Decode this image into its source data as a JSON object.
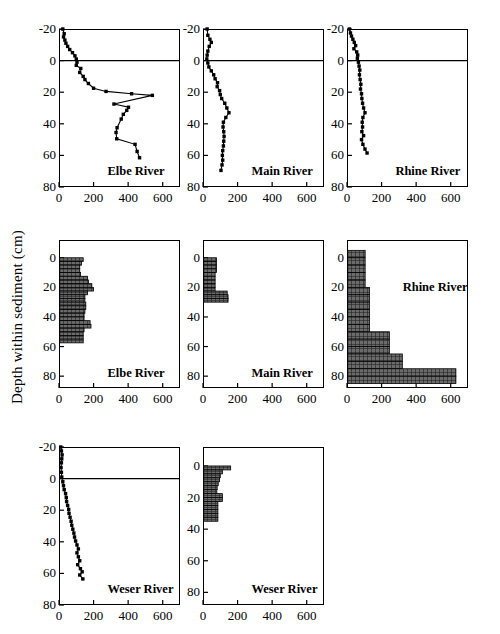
{
  "figure": {
    "y_axis_label": "Depth within sediment (cm)",
    "background_color": "#ffffff",
    "line_color": "#000000",
    "marker_color": "#000000",
    "bar_fill_color": "#6b6b6b",
    "bar_edge_color": "#000000"
  },
  "axes": {
    "y_ticks_profile": [
      "-20",
      "0",
      "20",
      "40",
      "60",
      "80"
    ],
    "y_ticks_bar": [
      "0",
      "20",
      "40",
      "60",
      "80"
    ],
    "x_ticks": [
      "0",
      "200",
      "400",
      "600"
    ],
    "ylim_profile": [
      -20,
      80
    ],
    "ylim_bar": [
      -12,
      88
    ],
    "xlim": [
      0,
      700
    ]
  },
  "panels": [
    {
      "key": "p1",
      "title": "Elbe River",
      "type": "line"
    },
    {
      "key": "p2",
      "title": "Main River",
      "type": "line"
    },
    {
      "key": "p3",
      "title": "Rhine River",
      "type": "line"
    },
    {
      "key": "p4",
      "title": "Elbe River",
      "type": "bar"
    },
    {
      "key": "p5",
      "title": "Main River",
      "type": "bar"
    },
    {
      "key": "p6",
      "title": "Rhine River",
      "type": "bar"
    },
    {
      "key": "p7",
      "title": "Weser River",
      "type": "line"
    },
    {
      "key": "p8",
      "title": "Weser River",
      "type": "bar"
    }
  ],
  "chart_data": [
    {
      "id": "elbe-profile",
      "type": "line",
      "title": "Elbe River",
      "xlabel": "",
      "ylabel": "Depth within sediment (cm)",
      "xlim": [
        0,
        700
      ],
      "ylim": [
        -20,
        80
      ],
      "y_inverted": true,
      "grid": false,
      "legend": "none",
      "x_ticks": [
        0,
        200,
        400,
        600
      ],
      "y_ticks": [
        -20,
        0,
        20,
        40,
        60,
        80
      ],
      "interface_line_y": 0,
      "points": [
        {
          "x": 22,
          "y": -20.0
        },
        {
          "x": 30,
          "y": -17.0
        },
        {
          "x": 26,
          "y": -15.0
        },
        {
          "x": 34,
          "y": -13.0
        },
        {
          "x": 40,
          "y": -11.0
        },
        {
          "x": 50,
          "y": -9.0
        },
        {
          "x": 62,
          "y": -7.0
        },
        {
          "x": 78,
          "y": -5.0
        },
        {
          "x": 92,
          "y": -3.0
        },
        {
          "x": 100,
          "y": -1.0
        },
        {
          "x": 104,
          "y": 1.0
        },
        {
          "x": 100,
          "y": 3.0
        },
        {
          "x": 126,
          "y": 5.0
        },
        {
          "x": 120,
          "y": 7.5
        },
        {
          "x": 140,
          "y": 10.0
        },
        {
          "x": 150,
          "y": 12.0
        },
        {
          "x": 170,
          "y": 14.5
        },
        {
          "x": 200,
          "y": 17.5
        },
        {
          "x": 272,
          "y": 19.5
        },
        {
          "x": 420,
          "y": 21.0
        },
        {
          "x": 540,
          "y": 22.0
        },
        {
          "x": 318,
          "y": 27.5
        },
        {
          "x": 402,
          "y": 29.5
        },
        {
          "x": 392,
          "y": 31.5
        },
        {
          "x": 372,
          "y": 34.0
        },
        {
          "x": 360,
          "y": 37.0
        },
        {
          "x": 336,
          "y": 42.5
        },
        {
          "x": 330,
          "y": 45.5
        },
        {
          "x": 334,
          "y": 49.5
        },
        {
          "x": 440,
          "y": 53.0
        },
        {
          "x": 452,
          "y": 57.5
        },
        {
          "x": 466,
          "y": 61.5
        }
      ]
    },
    {
      "id": "main-profile",
      "type": "line",
      "title": "Main River",
      "xlim": [
        0,
        700
      ],
      "ylim": [
        -20,
        80
      ],
      "y_inverted": true,
      "grid": false,
      "legend": "none",
      "x_ticks": [
        0,
        200,
        400,
        600
      ],
      "y_ticks": [
        -20,
        0,
        20,
        40,
        60,
        80
      ],
      "interface_line_y": 0,
      "points": [
        {
          "x": 24,
          "y": -20.0
        },
        {
          "x": 28,
          "y": -16.0
        },
        {
          "x": 40,
          "y": -13.5
        },
        {
          "x": 48,
          "y": -11.5
        },
        {
          "x": 36,
          "y": -9.0
        },
        {
          "x": 28,
          "y": -6.0
        },
        {
          "x": 24,
          "y": -3.5
        },
        {
          "x": 22,
          "y": -1.0
        },
        {
          "x": 28,
          "y": 1.5
        },
        {
          "x": 34,
          "y": 4.0
        },
        {
          "x": 48,
          "y": 6.5
        },
        {
          "x": 62,
          "y": 9.0
        },
        {
          "x": 70,
          "y": 11.5
        },
        {
          "x": 84,
          "y": 14.0
        },
        {
          "x": 82,
          "y": 16.5
        },
        {
          "x": 96,
          "y": 19.0
        },
        {
          "x": 100,
          "y": 21.5
        },
        {
          "x": 108,
          "y": 24.0
        },
        {
          "x": 126,
          "y": 27.0
        },
        {
          "x": 138,
          "y": 30.0
        },
        {
          "x": 150,
          "y": 33.0
        },
        {
          "x": 132,
          "y": 36.0
        },
        {
          "x": 118,
          "y": 39.0
        },
        {
          "x": 116,
          "y": 42.0
        },
        {
          "x": 120,
          "y": 45.0
        },
        {
          "x": 122,
          "y": 48.0
        },
        {
          "x": 120,
          "y": 51.0
        },
        {
          "x": 118,
          "y": 54.0
        },
        {
          "x": 114,
          "y": 57.0
        },
        {
          "x": 112,
          "y": 60.0
        },
        {
          "x": 114,
          "y": 63.0
        },
        {
          "x": 110,
          "y": 66.0
        },
        {
          "x": 104,
          "y": 69.5
        }
      ]
    },
    {
      "id": "rhine-profile",
      "type": "line",
      "title": "Rhine River",
      "xlim": [
        0,
        700
      ],
      "ylim": [
        -20,
        80
      ],
      "y_inverted": true,
      "grid": false,
      "legend": "none",
      "x_ticks": [
        0,
        200,
        400,
        600
      ],
      "y_ticks": [
        -20,
        0,
        20,
        40,
        60,
        80
      ],
      "interface_line_y": 0,
      "points": [
        {
          "x": 14,
          "y": -20.0
        },
        {
          "x": 20,
          "y": -17.5
        },
        {
          "x": 26,
          "y": -15.5
        },
        {
          "x": 34,
          "y": -13.5
        },
        {
          "x": 42,
          "y": -11.5
        },
        {
          "x": 50,
          "y": -9.5
        },
        {
          "x": 40,
          "y": -7.5
        },
        {
          "x": 56,
          "y": -5.5
        },
        {
          "x": 62,
          "y": -3.5
        },
        {
          "x": 60,
          "y": -1.5
        },
        {
          "x": 66,
          "y": 1.0
        },
        {
          "x": 70,
          "y": 3.5
        },
        {
          "x": 74,
          "y": 6.0
        },
        {
          "x": 72,
          "y": 9.0
        },
        {
          "x": 76,
          "y": 12.0
        },
        {
          "x": 80,
          "y": 15.0
        },
        {
          "x": 78,
          "y": 18.0
        },
        {
          "x": 84,
          "y": 21.0
        },
        {
          "x": 86,
          "y": 24.0
        },
        {
          "x": 90,
          "y": 27.0
        },
        {
          "x": 96,
          "y": 30.0
        },
        {
          "x": 104,
          "y": 33.0
        },
        {
          "x": 92,
          "y": 36.0
        },
        {
          "x": 88,
          "y": 39.0
        },
        {
          "x": 90,
          "y": 42.0
        },
        {
          "x": 86,
          "y": 45.0
        },
        {
          "x": 96,
          "y": 47.5
        },
        {
          "x": 84,
          "y": 50.0
        },
        {
          "x": 92,
          "y": 53.0
        },
        {
          "x": 104,
          "y": 56.0
        },
        {
          "x": 116,
          "y": 58.5
        }
      ]
    },
    {
      "id": "elbe-bar",
      "type": "bar",
      "title": "Elbe River",
      "xlim": [
        0,
        700
      ],
      "ylim": [
        -12,
        88
      ],
      "y_inverted": true,
      "grid": false,
      "legend": "none",
      "x_ticks": [
        0,
        200,
        400,
        600
      ],
      "y_ticks": [
        0,
        20,
        40,
        60,
        80
      ],
      "orientation": "horizontal",
      "bin_height": 2.5,
      "bins": [
        {
          "depth_top": 0.0,
          "value": 140
        },
        {
          "depth_top": 2.5,
          "value": 130
        },
        {
          "depth_top": 5.0,
          "value": 120
        },
        {
          "depth_top": 7.5,
          "value": 120
        },
        {
          "depth_top": 10.0,
          "value": 125
        },
        {
          "depth_top": 12.5,
          "value": 165
        },
        {
          "depth_top": 15.0,
          "value": 170
        },
        {
          "depth_top": 17.5,
          "value": 190
        },
        {
          "depth_top": 20.0,
          "value": 200
        },
        {
          "depth_top": 22.5,
          "value": 165
        },
        {
          "depth_top": 25.0,
          "value": 150
        },
        {
          "depth_top": 27.5,
          "value": 150
        },
        {
          "depth_top": 30.0,
          "value": 155
        },
        {
          "depth_top": 32.5,
          "value": 155
        },
        {
          "depth_top": 35.0,
          "value": 150
        },
        {
          "depth_top": 37.5,
          "value": 145
        },
        {
          "depth_top": 40.0,
          "value": 145
        },
        {
          "depth_top": 42.5,
          "value": 180
        },
        {
          "depth_top": 45.0,
          "value": 185
        },
        {
          "depth_top": 47.5,
          "value": 145
        },
        {
          "depth_top": 50.0,
          "value": 140
        },
        {
          "depth_top": 52.5,
          "value": 140
        },
        {
          "depth_top": 55.0,
          "value": 140
        }
      ]
    },
    {
      "id": "main-bar",
      "type": "bar",
      "title": "Main River",
      "xlim": [
        0,
        700
      ],
      "ylim": [
        -12,
        88
      ],
      "y_inverted": true,
      "grid": false,
      "legend": "none",
      "x_ticks": [
        0,
        200,
        400,
        600
      ],
      "y_ticks": [
        0,
        20,
        40,
        60,
        80
      ],
      "orientation": "horizontal",
      "bin_height": 2.5,
      "bins": [
        {
          "depth_top": 0.0,
          "value": 78
        },
        {
          "depth_top": 2.5,
          "value": 78
        },
        {
          "depth_top": 5.0,
          "value": 78
        },
        {
          "depth_top": 7.5,
          "value": 78
        },
        {
          "depth_top": 10.0,
          "value": 70
        },
        {
          "depth_top": 12.5,
          "value": 70
        },
        {
          "depth_top": 15.0,
          "value": 70
        },
        {
          "depth_top": 17.5,
          "value": 70
        },
        {
          "depth_top": 20.0,
          "value": 70
        },
        {
          "depth_top": 22.5,
          "value": 140
        },
        {
          "depth_top": 25.0,
          "value": 145
        },
        {
          "depth_top": 27.5,
          "value": 145
        }
      ]
    },
    {
      "id": "rhine-bar",
      "type": "bar",
      "title": "Rhine River",
      "xlim": [
        0,
        700
      ],
      "ylim": [
        -12,
        88
      ],
      "y_inverted": true,
      "grid": false,
      "legend": "none",
      "x_ticks": [
        0,
        200,
        400,
        600
      ],
      "y_ticks": [
        0,
        20,
        40,
        60,
        80
      ],
      "orientation": "horizontal",
      "bin_height": 5.0,
      "bins": [
        {
          "depth_top": -5.0,
          "value": 105
        },
        {
          "depth_top": 0.0,
          "value": 105
        },
        {
          "depth_top": 5.0,
          "value": 105
        },
        {
          "depth_top": 10.0,
          "value": 105
        },
        {
          "depth_top": 15.0,
          "value": 105
        },
        {
          "depth_top": 20.0,
          "value": 130
        },
        {
          "depth_top": 25.0,
          "value": 130
        },
        {
          "depth_top": 30.0,
          "value": 130
        },
        {
          "depth_top": 35.0,
          "value": 130
        },
        {
          "depth_top": 40.0,
          "value": 130
        },
        {
          "depth_top": 45.0,
          "value": 130
        },
        {
          "depth_top": 50.0,
          "value": 245
        },
        {
          "depth_top": 55.0,
          "value": 245
        },
        {
          "depth_top": 60.0,
          "value": 245
        },
        {
          "depth_top": 65.0,
          "value": 320
        },
        {
          "depth_top": 70.0,
          "value": 320
        },
        {
          "depth_top": 75.0,
          "value": 630
        },
        {
          "depth_top": 80.0,
          "value": 630
        }
      ]
    },
    {
      "id": "weser-profile",
      "type": "line",
      "title": "Weser River",
      "xlim": [
        0,
        700
      ],
      "ylim": [
        -20,
        80
      ],
      "y_inverted": true,
      "grid": false,
      "legend": "none",
      "x_ticks": [
        0,
        200,
        400,
        600
      ],
      "y_ticks": [
        -20,
        0,
        20,
        40,
        60,
        80
      ],
      "interface_line_y": 0,
      "points": [
        {
          "x": 10,
          "y": -20.0
        },
        {
          "x": 14,
          "y": -17.5
        },
        {
          "x": 18,
          "y": -15.0
        },
        {
          "x": 16,
          "y": -12.5
        },
        {
          "x": 14,
          "y": -10.0
        },
        {
          "x": 12,
          "y": -7.0
        },
        {
          "x": 14,
          "y": -4.0
        },
        {
          "x": 16,
          "y": -1.0
        },
        {
          "x": 22,
          "y": 2.0
        },
        {
          "x": 26,
          "y": 4.5
        },
        {
          "x": 30,
          "y": 7.0
        },
        {
          "x": 38,
          "y": 9.5
        },
        {
          "x": 42,
          "y": 12.0
        },
        {
          "x": 44,
          "y": 14.5
        },
        {
          "x": 50,
          "y": 17.0
        },
        {
          "x": 56,
          "y": 19.5
        },
        {
          "x": 58,
          "y": 22.0
        },
        {
          "x": 64,
          "y": 24.5
        },
        {
          "x": 70,
          "y": 27.0
        },
        {
          "x": 74,
          "y": 29.5
        },
        {
          "x": 80,
          "y": 32.0
        },
        {
          "x": 86,
          "y": 34.5
        },
        {
          "x": 90,
          "y": 37.0
        },
        {
          "x": 96,
          "y": 39.5
        },
        {
          "x": 104,
          "y": 42.0
        },
        {
          "x": 112,
          "y": 44.5
        },
        {
          "x": 104,
          "y": 47.0
        },
        {
          "x": 112,
          "y": 49.5
        },
        {
          "x": 120,
          "y": 52.0
        },
        {
          "x": 108,
          "y": 54.5
        },
        {
          "x": 124,
          "y": 57.0
        },
        {
          "x": 134,
          "y": 59.0
        },
        {
          "x": 120,
          "y": 61.0
        },
        {
          "x": 138,
          "y": 63.5
        }
      ]
    },
    {
      "id": "weser-bar",
      "type": "bar",
      "title": "Weser River",
      "xlim": [
        0,
        700
      ],
      "ylim": [
        -12,
        88
      ],
      "y_inverted": true,
      "grid": false,
      "legend": "none",
      "x_ticks": [
        0,
        200,
        400,
        600
      ],
      "y_ticks": [
        0,
        20,
        40,
        60,
        80
      ],
      "orientation": "horizontal",
      "bin_height": 2.5,
      "bins": [
        {
          "depth_top": 0.0,
          "value": 160
        },
        {
          "depth_top": 2.5,
          "value": 112
        },
        {
          "depth_top": 5.0,
          "value": 100
        },
        {
          "depth_top": 7.5,
          "value": 96
        },
        {
          "depth_top": 10.0,
          "value": 88
        },
        {
          "depth_top": 12.5,
          "value": 82
        },
        {
          "depth_top": 15.0,
          "value": 80
        },
        {
          "depth_top": 17.5,
          "value": 112
        },
        {
          "depth_top": 20.0,
          "value": 112
        },
        {
          "depth_top": 22.5,
          "value": 86
        },
        {
          "depth_top": 25.0,
          "value": 86
        },
        {
          "depth_top": 27.5,
          "value": 86
        },
        {
          "depth_top": 30.0,
          "value": 86
        },
        {
          "depth_top": 32.5,
          "value": 86
        }
      ]
    }
  ]
}
